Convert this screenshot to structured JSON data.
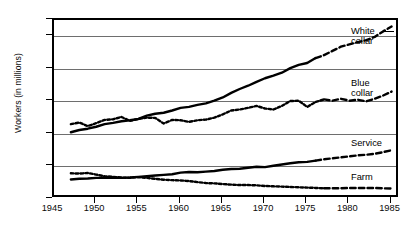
{
  "axes": {
    "ylabel": "Workers (in millions)",
    "yticks": [
      "0",
      "10",
      "20",
      "30",
      "40",
      "50",
      "55"
    ],
    "xticks": [
      "1945",
      "1950",
      "1955",
      "1960",
      "1965",
      "1970",
      "1975",
      "1980",
      "1985"
    ]
  },
  "labels": {
    "white_collar": "White\ncollar",
    "blue_collar": "Blue\ncollar",
    "service": "Service",
    "farm": "Farm"
  },
  "chart_data": {
    "type": "line",
    "title": "",
    "xlabel": "",
    "ylabel": "Workers (in millions)",
    "xlim": [
      1945,
      1986
    ],
    "ylim": [
      0,
      55
    ],
    "grid": true,
    "legend_position": "right-inline",
    "yticks": [
      0,
      10,
      20,
      30,
      40,
      50,
      55
    ],
    "xticks": [
      1945,
      1950,
      1955,
      1960,
      1965,
      1970,
      1975,
      1980,
      1985
    ],
    "series": [
      {
        "name": "White collar",
        "style": "solid-then-dashed",
        "solid_until": 1976,
        "x": [
          1947,
          1948,
          1949,
          1950,
          1951,
          1952,
          1953,
          1954,
          1955,
          1956,
          1957,
          1958,
          1959,
          1960,
          1961,
          1962,
          1963,
          1964,
          1965,
          1966,
          1967,
          1968,
          1969,
          1970,
          1971,
          1972,
          1973,
          1974,
          1975,
          1976,
          1977,
          1978,
          1979,
          1980,
          1981,
          1982,
          1983,
          1984,
          1985
        ],
        "values": [
          20.5,
          21.2,
          21.6,
          22.2,
          23.0,
          23.4,
          23.9,
          24.2,
          24.6,
          25.6,
          26.2,
          26.5,
          27.2,
          28.0,
          28.3,
          28.9,
          29.4,
          30.2,
          31.2,
          32.6,
          33.8,
          34.8,
          36.0,
          37.1,
          37.9,
          38.8,
          40.2,
          41.2,
          41.8,
          43.3,
          44.2,
          45.5,
          46.8,
          47.5,
          48.2,
          48.8,
          49.8,
          51.5,
          53.0
        ]
      },
      {
        "name": "Blue collar",
        "style": "dotted-then-dashed",
        "dotted_until": 1977,
        "x": [
          1947,
          1948,
          1949,
          1950,
          1951,
          1952,
          1953,
          1954,
          1955,
          1956,
          1957,
          1958,
          1959,
          1960,
          1961,
          1962,
          1963,
          1964,
          1965,
          1966,
          1967,
          1968,
          1969,
          1970,
          1971,
          1972,
          1973,
          1974,
          1975,
          1976,
          1977,
          1978,
          1979,
          1980,
          1981,
          1982,
          1983,
          1984,
          1985
        ],
        "values": [
          23.0,
          23.5,
          22.4,
          23.3,
          24.3,
          24.5,
          25.2,
          24.0,
          24.6,
          25.0,
          24.9,
          23.2,
          24.3,
          24.2,
          23.7,
          24.2,
          24.4,
          25.0,
          26.0,
          27.2,
          27.5,
          28.0,
          28.6,
          27.8,
          27.5,
          28.6,
          30.1,
          30.2,
          28.3,
          29.8,
          30.6,
          30.2,
          30.8,
          30.2,
          30.5,
          30.0,
          30.8,
          31.8,
          33.0
        ]
      },
      {
        "name": "Service",
        "style": "solid-then-dashed",
        "solid_until": 1976,
        "x": [
          1947,
          1948,
          1949,
          1950,
          1951,
          1952,
          1953,
          1954,
          1955,
          1956,
          1957,
          1958,
          1959,
          1960,
          1961,
          1962,
          1963,
          1964,
          1965,
          1966,
          1967,
          1968,
          1969,
          1970,
          1971,
          1972,
          1973,
          1974,
          1975,
          1976,
          1977,
          1978,
          1979,
          1980,
          1981,
          1982,
          1983,
          1984,
          1985
        ],
        "values": [
          6.0,
          6.2,
          6.3,
          6.5,
          6.5,
          6.6,
          6.5,
          6.6,
          6.8,
          7.0,
          7.2,
          7.4,
          7.6,
          8.1,
          8.3,
          8.2,
          8.4,
          8.6,
          9.0,
          9.2,
          9.3,
          9.6,
          9.9,
          9.8,
          10.2,
          10.6,
          11.0,
          11.3,
          11.4,
          11.8,
          12.2,
          12.5,
          12.8,
          13.1,
          13.4,
          13.6,
          13.9,
          14.4,
          15.0
        ]
      },
      {
        "name": "Farm",
        "style": "dotted-then-dashed",
        "dotted_until": 1977,
        "x": [
          1947,
          1948,
          1949,
          1950,
          1951,
          1952,
          1953,
          1954,
          1955,
          1956,
          1957,
          1958,
          1959,
          1960,
          1961,
          1962,
          1963,
          1964,
          1965,
          1966,
          1967,
          1968,
          1969,
          1970,
          1971,
          1972,
          1973,
          1974,
          1975,
          1976,
          1977,
          1978,
          1979,
          1980,
          1981,
          1982,
          1983,
          1984,
          1985
        ],
        "values": [
          7.9,
          7.8,
          8.0,
          7.5,
          7.0,
          6.8,
          6.6,
          6.5,
          6.7,
          6.5,
          6.2,
          5.9,
          5.8,
          5.7,
          5.5,
          5.2,
          4.9,
          4.8,
          4.6,
          4.4,
          4.3,
          4.3,
          4.2,
          4.0,
          3.9,
          3.8,
          3.7,
          3.6,
          3.5,
          3.4,
          3.3,
          3.3,
          3.3,
          3.4,
          3.4,
          3.4,
          3.4,
          3.3,
          3.2
        ]
      }
    ]
  }
}
